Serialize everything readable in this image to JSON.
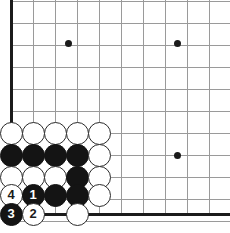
{
  "diagram": {
    "type": "go-board-problem",
    "board": {
      "width_px": 230,
      "height_px": 233,
      "grid_spacing_px": 22,
      "origin_x_px": 11,
      "origin_y_px": 1,
      "columns": 11,
      "rows": 11,
      "edges": [
        "left",
        "bottom"
      ],
      "line_color": "#9a9a9a",
      "edge_color": "#1b1b1b",
      "background_color": "#ffffff"
    },
    "star_points": [
      {
        "x": 68,
        "y": 43
      },
      {
        "x": 177,
        "y": 43
      },
      {
        "x": 177,
        "y": 155
      }
    ],
    "stones": [
      {
        "color": "white",
        "x": 11,
        "y": 133,
        "label": ""
      },
      {
        "color": "white",
        "x": 33,
        "y": 133,
        "label": ""
      },
      {
        "color": "white",
        "x": 55,
        "y": 133,
        "label": ""
      },
      {
        "color": "white",
        "x": 77,
        "y": 133,
        "label": ""
      },
      {
        "color": "white",
        "x": 99,
        "y": 133,
        "label": ""
      },
      {
        "color": "black",
        "x": 11,
        "y": 155,
        "label": ""
      },
      {
        "color": "black",
        "x": 33,
        "y": 155,
        "label": ""
      },
      {
        "color": "black",
        "x": 55,
        "y": 155,
        "label": ""
      },
      {
        "color": "black",
        "x": 77,
        "y": 155,
        "label": ""
      },
      {
        "color": "white",
        "x": 99,
        "y": 155,
        "label": ""
      },
      {
        "color": "white",
        "x": 11,
        "y": 177,
        "label": ""
      },
      {
        "color": "white",
        "x": 33,
        "y": 177,
        "label": ""
      },
      {
        "color": "white",
        "x": 55,
        "y": 177,
        "label": ""
      },
      {
        "color": "black",
        "x": 77,
        "y": 177,
        "label": ""
      },
      {
        "color": "white",
        "x": 99,
        "y": 177,
        "label": ""
      },
      {
        "color": "white",
        "x": 11,
        "y": 195,
        "label": "4"
      },
      {
        "color": "black",
        "x": 33,
        "y": 195,
        "label": "1"
      },
      {
        "color": "black",
        "x": 55,
        "y": 195,
        "label": ""
      },
      {
        "color": "black",
        "x": 77,
        "y": 195,
        "label": ""
      },
      {
        "color": "white",
        "x": 99,
        "y": 195,
        "label": ""
      },
      {
        "color": "black",
        "x": 11,
        "y": 214,
        "label": "3"
      },
      {
        "color": "white",
        "x": 33,
        "y": 214,
        "label": "2"
      },
      {
        "color": "white",
        "x": 77,
        "y": 214,
        "label": ""
      }
    ],
    "move_sequence": [
      {
        "number": "1",
        "color": "black"
      },
      {
        "number": "2",
        "color": "white"
      },
      {
        "number": "3",
        "color": "black"
      },
      {
        "number": "4",
        "color": "white"
      }
    ]
  }
}
